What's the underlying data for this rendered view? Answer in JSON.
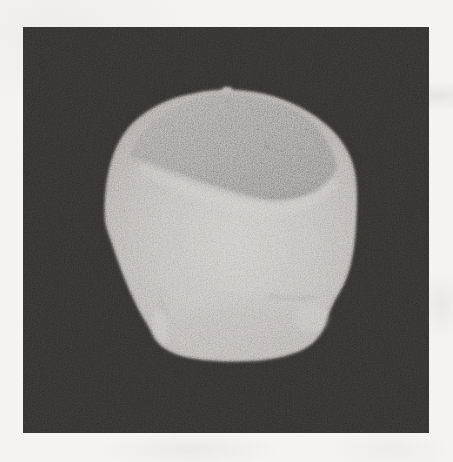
{
  "figure": {
    "type": "grayscale scanned photograph",
    "subject": "3D surface rendering of a human head seen from the back, tilted slightly forward, with the top of the skull cut away leaving a flat oblique gray cut plane; ears faintly visible at the lower left and lower right",
    "alt": "Rendered head with truncated crown on a black square background",
    "setting": "black square figure centered on a white scanned page with film grain"
  },
  "colors": {
    "page_background": "#f4f3f1",
    "frame_background": "#2b2a28",
    "head_surface_light": "#bfbdb9",
    "head_surface_mid": "#b2b0ac",
    "head_surface_dark": "#8f8c87",
    "cut_plane_light": "#989692",
    "cut_plane_dark": "#828180",
    "mole_dot": "#6b6966"
  }
}
